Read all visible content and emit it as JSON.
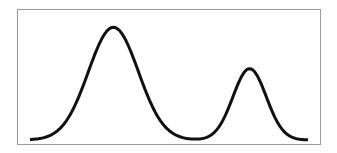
{
  "chart_data": {
    "type": "line",
    "title": "",
    "xlabel": "",
    "ylabel": "",
    "xlim": [
      0,
      10
    ],
    "ylim": [
      0,
      1.0
    ],
    "grid": false,
    "legend": "none",
    "line_color": "#111111",
    "frame_color": "#9a9a9a",
    "series": [
      {
        "name": "bimodal-density",
        "components": [
          {
            "mean": 3.0,
            "sd": 0.9,
            "peak": 0.98
          },
          {
            "mean": 7.9,
            "sd": 0.6,
            "peak": 0.62
          }
        ],
        "x": [
          0.0,
          0.5,
          1.0,
          1.5,
          2.0,
          2.5,
          3.0,
          3.5,
          4.0,
          4.5,
          5.0,
          5.5,
          6.0,
          6.5,
          7.0,
          7.5,
          7.9,
          8.5,
          9.0,
          9.5,
          10.0
        ],
        "y": [
          0.02,
          0.04,
          0.09,
          0.24,
          0.53,
          0.84,
          0.98,
          0.84,
          0.53,
          0.24,
          0.09,
          0.03,
          0.03,
          0.08,
          0.22,
          0.49,
          0.62,
          0.38,
          0.11,
          0.03,
          0.02
        ]
      }
    ]
  }
}
